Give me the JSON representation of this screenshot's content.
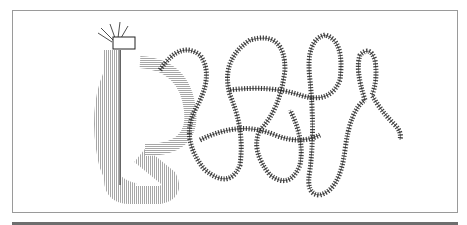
{
  "figure": {
    "colors": {
      "ink": "#1a1a1a",
      "frame": "#9a9a9a",
      "rule": "#6e6e6e",
      "background": "#ffffff"
    }
  }
}
